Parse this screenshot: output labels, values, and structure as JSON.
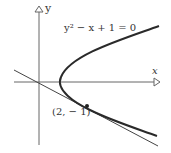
{
  "diagram": {
    "equation": "y² − x + 1 = 0",
    "x_label": "x",
    "y_label": "y",
    "point_label": "(2, − 1)",
    "colors": {
      "curve": "#2a2a2a",
      "axis": "#555555",
      "tangent": "#444444"
    }
  }
}
